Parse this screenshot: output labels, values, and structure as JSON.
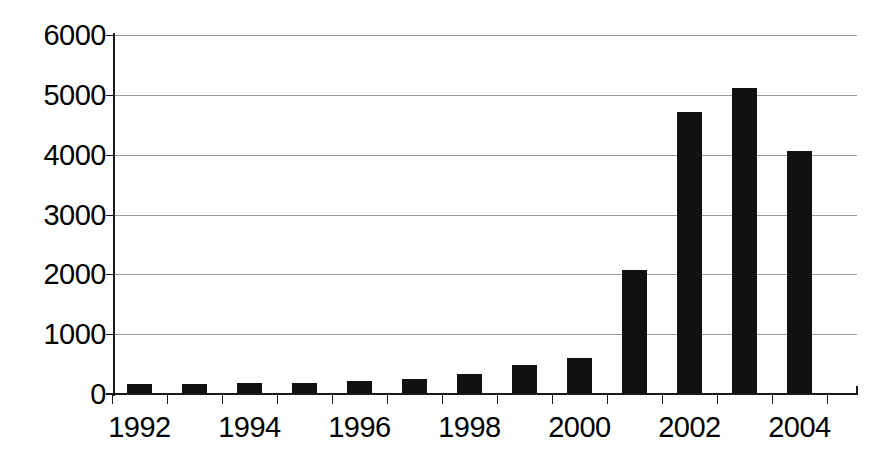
{
  "chart_data": {
    "type": "bar",
    "title": "",
    "subtitle": "",
    "xlabel": "",
    "ylabel": "",
    "categories": [
      "1992",
      "1993",
      "1994",
      "1995",
      "1996",
      "1997",
      "1998",
      "1999",
      "2000",
      "2001",
      "2002",
      "2003",
      "2004"
    ],
    "values": [
      160,
      160,
      190,
      190,
      220,
      250,
      330,
      480,
      610,
      2080,
      4720,
      5120,
      4060
    ],
    "series": [
      {
        "name": "",
        "values": [
          160,
          160,
          190,
          190,
          220,
          250,
          330,
          480,
          610,
          2080,
          4720,
          5120,
          4060
        ]
      }
    ],
    "ylim": [
      0,
      6000
    ],
    "ytick_values": [
      0,
      1000,
      2000,
      3000,
      4000,
      5000,
      6000
    ],
    "ytick_labels": [
      "0",
      "1000",
      "2000",
      "3000",
      "4000",
      "5000",
      "6000"
    ],
    "xtick_labels": [
      "1992",
      "1994",
      "1996",
      "1998",
      "2000",
      "2002",
      "2004"
    ],
    "xtick_label_categories": [
      "1992",
      "1994",
      "1996",
      "1998",
      "2000",
      "2002",
      "2004"
    ],
    "grid": true,
    "legend": false,
    "legend_position": "none",
    "bar_color": "#111111",
    "grid_color": "#9b9b9b",
    "axis_color": "#1a1a1a",
    "background_color": "#ffffff"
  }
}
